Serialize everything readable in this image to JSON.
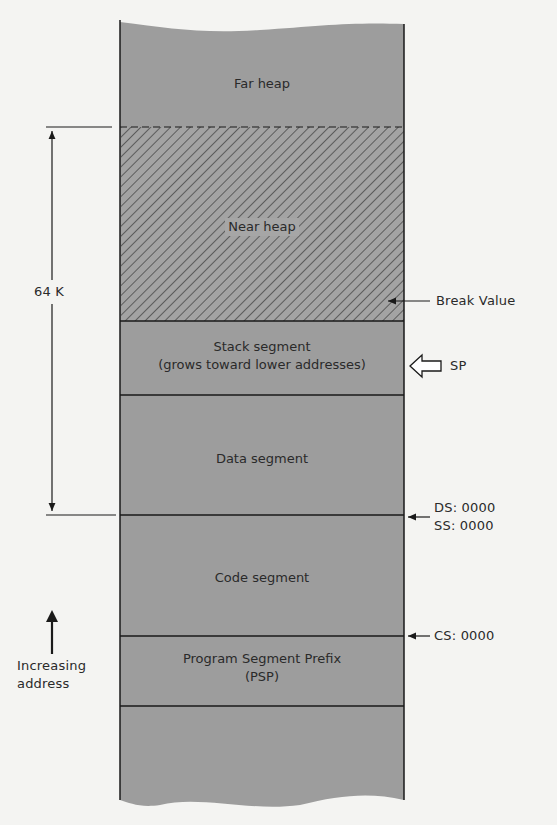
{
  "diagram": {
    "segments": [
      {
        "id": "far-heap",
        "label": "Far heap"
      },
      {
        "id": "near-heap",
        "label": "Near heap"
      },
      {
        "id": "stack",
        "label": "Stack segment",
        "sublabel": "(grows toward lower addresses)"
      },
      {
        "id": "data",
        "label": "Data segment"
      },
      {
        "id": "code",
        "label": "Code segment"
      },
      {
        "id": "psp",
        "label": "Program Segment Prefix",
        "sublabel": "(PSP)"
      }
    ],
    "annotations": {
      "size_label": "64 K",
      "break_value": "Break Value",
      "sp": "SP",
      "ds": "DS: 0000",
      "ss": "SS: 0000",
      "cs": "CS: 0000",
      "direction_line1": "Increasing",
      "direction_line2": "address"
    },
    "colors": {
      "fill": "#9d9d9d",
      "line": "#1a1a1a",
      "background": "#f4f4f2"
    }
  }
}
